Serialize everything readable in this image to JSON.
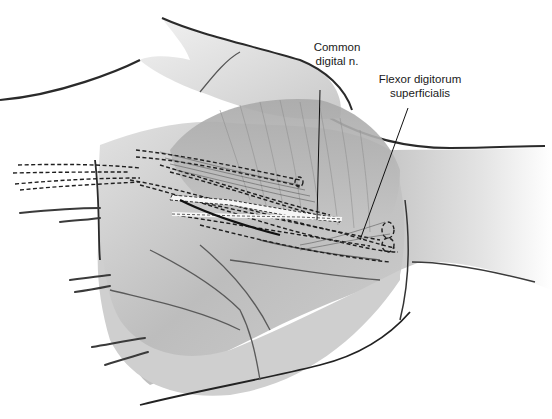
{
  "figure": {
    "colors": {
      "background": "#ffffff",
      "skin_light": "#d9d9d9",
      "skin_mid": "#b5b5b5",
      "skin_dark": "#8a8a8a",
      "outline": "#2a2a2a",
      "nerve_highlight": "#f4f4f4",
      "dashed_line": "#1e1e1e"
    },
    "labels": [
      {
        "id": "common-digital-nerve",
        "line1": "Common",
        "line2": "digital n."
      },
      {
        "id": "flexor-digitorum-superficialis",
        "line1": "Flexor digitorum",
        "line2": "superficialis"
      }
    ]
  }
}
